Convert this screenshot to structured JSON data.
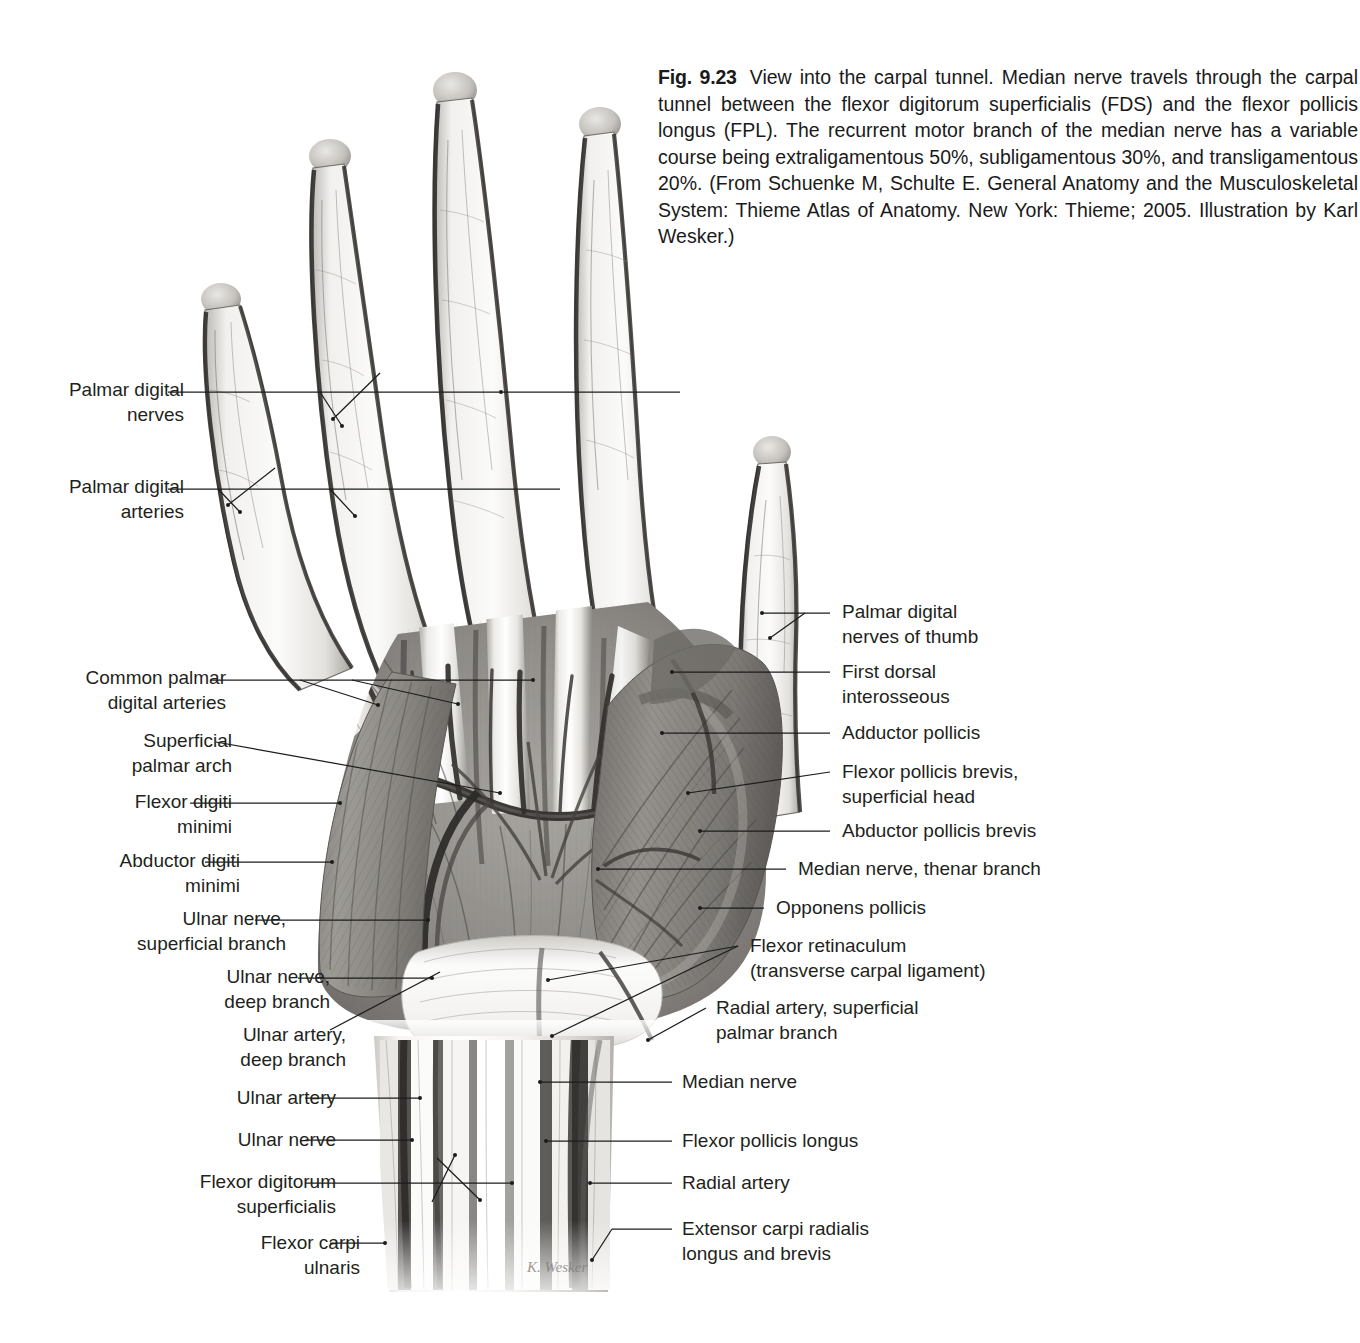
{
  "figure": {
    "number": "Fig. 9.23",
    "caption": "View into the carpal tunnel. Median nerve travels through the carpal tunnel between the flexor digitorum superficialis (FDS) and the flexor pollicis longus (FPL). The recurrent motor branch of the median nerve has a variable course being extraligamentous 50%, subligamentous 30%, and transligamentous 20%. (From Schuenke M, Schulte E. General Anatomy and the Musculoskeletal System: Thieme Atlas of Anatomy. New York: Thieme; 2005. Illustration by Karl Wesker.)",
    "signature": "K. Wesker"
  },
  "labels_left": [
    {
      "id": "palmar-digital-nerves",
      "text": "Palmar digital\nnerves"
    },
    {
      "id": "palmar-digital-arteries",
      "text": "Palmar digital\narteries"
    },
    {
      "id": "common-palmar-digital-arteries",
      "text": "Common palmar\ndigital arteries"
    },
    {
      "id": "superficial-palmar-arch",
      "text": "Superficial\npalmar arch"
    },
    {
      "id": "flexor-digiti-minimi",
      "text": "Flexor digiti\nminimi"
    },
    {
      "id": "abductor-digiti-minimi",
      "text": "Abductor digiti\nminimi"
    },
    {
      "id": "ulnar-nerve-superficial-branch",
      "text": "Ulnar nerve,\nsuperficial branch"
    },
    {
      "id": "ulnar-nerve-deep-branch",
      "text": "Ulnar nerve,\ndeep branch"
    },
    {
      "id": "ulnar-artery-deep-branch",
      "text": "Ulnar artery,\ndeep branch"
    },
    {
      "id": "ulnar-artery",
      "text": "Ulnar artery"
    },
    {
      "id": "ulnar-nerve",
      "text": "Ulnar nerve"
    },
    {
      "id": "flexor-digitorum-superficialis",
      "text": "Flexor digitorum\nsuperficialis"
    },
    {
      "id": "flexor-carpi-ulnaris",
      "text": "Flexor carpi\nulnaris"
    }
  ],
  "labels_right": [
    {
      "id": "palmar-digital-nerves-of-thumb",
      "text": "Palmar digital\nnerves of thumb"
    },
    {
      "id": "first-dorsal-interosseous",
      "text": "First dorsal\ninterosseous"
    },
    {
      "id": "adductor-pollicis",
      "text": "Adductor pollicis"
    },
    {
      "id": "flexor-pollicis-brevis",
      "text": "Flexor pollicis brevis,\nsuperficial head"
    },
    {
      "id": "abductor-pollicis-brevis",
      "text": "Abductor pollicis brevis"
    },
    {
      "id": "median-nerve-thenar-branch",
      "text": "Median nerve, thenar branch"
    },
    {
      "id": "opponens-pollicis",
      "text": "Opponens pollicis"
    },
    {
      "id": "flexor-retinaculum",
      "text": "Flexor retinaculum\n(transverse carpal ligament)"
    },
    {
      "id": "radial-artery-superficial-palmar-branch",
      "text": "Radial artery, superficial\npalmar branch"
    },
    {
      "id": "median-nerve",
      "text": "Median nerve"
    },
    {
      "id": "flexor-pollicis-longus",
      "text": "Flexor pollicis longus"
    },
    {
      "id": "radial-artery",
      "text": "Radial artery"
    },
    {
      "id": "extensor-carpi-radialis",
      "text": "Extensor carpi radialis\nlongus and brevis"
    }
  ],
  "colors": {
    "background": "#ffffff",
    "text": "#231f20",
    "leader_line": "#1c1c1c",
    "tissue_light": "#f2f1ef",
    "tissue_mid": "#9b9893",
    "tissue_dark": "#4a4744",
    "vessel": "#2b2826"
  }
}
